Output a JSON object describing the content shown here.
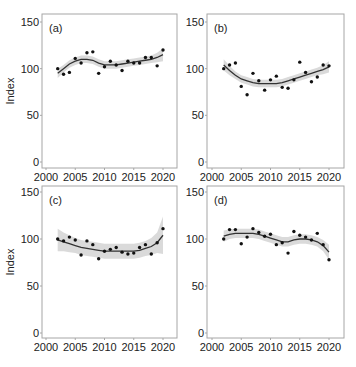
{
  "chart_data": [
    {
      "type": "scatter",
      "panel_label": "(a)",
      "ylabel": "Index",
      "xlabel": "",
      "xlim": [
        2000,
        2021
      ],
      "ylim": [
        0,
        150
      ],
      "x_ticks": [
        2000,
        2005,
        2010,
        2015,
        2020
      ],
      "y_ticks": [
        0,
        50,
        100,
        150
      ],
      "grid": false,
      "x": [
        2002,
        2003,
        2004,
        2005,
        2006,
        2007,
        2008,
        2009,
        2010,
        2011,
        2012,
        2013,
        2014,
        2015,
        2016,
        2017,
        2018,
        2019,
        2020
      ],
      "points": [
        100,
        94,
        96,
        111,
        106,
        117,
        118,
        95,
        102,
        108,
        104,
        98,
        108,
        106,
        106,
        112,
        112,
        103,
        120
      ],
      "smooth": [
        95,
        100,
        105,
        108,
        110,
        110,
        109,
        106,
        104,
        104,
        104,
        105,
        106,
        107,
        108,
        109,
        110,
        112,
        115
      ],
      "ci_halfwidth": [
        5,
        4,
        4,
        4,
        4,
        4,
        4,
        4,
        4,
        4,
        4,
        4,
        4,
        4,
        4,
        4,
        4,
        5,
        7
      ]
    },
    {
      "type": "scatter",
      "panel_label": "(b)",
      "ylabel": "",
      "xlabel": "",
      "xlim": [
        2000,
        2021
      ],
      "ylim": [
        0,
        150
      ],
      "x_ticks": [
        2000,
        2005,
        2010,
        2015,
        2020
      ],
      "y_ticks": [
        0,
        50,
        100,
        150
      ],
      "grid": false,
      "x": [
        2002,
        2003,
        2004,
        2005,
        2006,
        2007,
        2008,
        2009,
        2010,
        2011,
        2012,
        2013,
        2014,
        2015,
        2016,
        2017,
        2018,
        2019,
        2020
      ],
      "points": [
        100,
        104,
        106,
        81,
        72,
        95,
        87,
        77,
        88,
        92,
        80,
        79,
        88,
        107,
        96,
        86,
        91,
        104,
        103
      ],
      "smooth": [
        104,
        98,
        93,
        89,
        87,
        85,
        84,
        84,
        84,
        84,
        85,
        87,
        89,
        91,
        93,
        95,
        97,
        99,
        102
      ],
      "ci_halfwidth": [
        6,
        5,
        4,
        4,
        4,
        4,
        4,
        4,
        4,
        4,
        4,
        4,
        4,
        4,
        4,
        4,
        4,
        5,
        6
      ]
    },
    {
      "type": "scatter",
      "panel_label": "(c)",
      "ylabel": "Index",
      "xlabel": "",
      "xlim": [
        2000,
        2021
      ],
      "ylim": [
        0,
        150
      ],
      "x_ticks": [
        2000,
        2005,
        2010,
        2015,
        2020
      ],
      "y_ticks": [
        0,
        50,
        100,
        150
      ],
      "grid": false,
      "x": [
        2002,
        2003,
        2004,
        2005,
        2006,
        2007,
        2008,
        2009,
        2010,
        2011,
        2012,
        2013,
        2014,
        2015,
        2016,
        2017,
        2018,
        2019,
        2020
      ],
      "points": [
        100,
        98,
        102,
        99,
        83,
        98,
        94,
        79,
        87,
        89,
        91,
        86,
        84,
        85,
        91,
        94,
        84,
        96,
        111
      ],
      "smooth": [
        99,
        97,
        95,
        93,
        91,
        90,
        89,
        88,
        87,
        87,
        87,
        87,
        87,
        87,
        88,
        90,
        92,
        96,
        104
      ],
      "ci_halfwidth": [
        12,
        10,
        9,
        8,
        8,
        8,
        8,
        8,
        8,
        8,
        8,
        8,
        8,
        8,
        8,
        8,
        9,
        11,
        20
      ]
    },
    {
      "type": "scatter",
      "panel_label": "(d)",
      "ylabel": "",
      "xlabel": "",
      "xlim": [
        2000,
        2021
      ],
      "ylim": [
        0,
        150
      ],
      "x_ticks": [
        2000,
        2005,
        2010,
        2015,
        2020
      ],
      "y_ticks": [
        0,
        50,
        100,
        150
      ],
      "grid": false,
      "x": [
        2002,
        2003,
        2004,
        2005,
        2006,
        2007,
        2008,
        2009,
        2010,
        2011,
        2012,
        2013,
        2014,
        2015,
        2016,
        2017,
        2018,
        2019,
        2020
      ],
      "points": [
        100,
        110,
        110,
        95,
        102,
        111,
        107,
        103,
        105,
        94,
        96,
        85,
        108,
        104,
        102,
        99,
        106,
        94,
        78
      ],
      "smooth": [
        103,
        105,
        106,
        106,
        106,
        106,
        105,
        103,
        101,
        99,
        97,
        97,
        99,
        100,
        100,
        99,
        97,
        93,
        86
      ],
      "ci_halfwidth": [
        6,
        5,
        5,
        5,
        5,
        5,
        5,
        5,
        5,
        5,
        5,
        5,
        5,
        5,
        5,
        5,
        5,
        6,
        8
      ]
    }
  ],
  "panels_layout": [
    {
      "frame": [
        42,
        14,
        177,
        168
      ],
      "y0": 162,
      "y150": 22,
      "x2000": 46,
      "x2020": 163
    },
    {
      "frame": [
        207,
        14,
        344,
        168
      ],
      "y0": 162,
      "y150": 22,
      "x2000": 212,
      "x2020": 329
    },
    {
      "frame": [
        42,
        186,
        177,
        338
      ],
      "y0": 333,
      "y150": 192,
      "x2000": 46,
      "x2020": 163
    },
    {
      "frame": [
        207,
        186,
        344,
        338
      ],
      "y0": 333,
      "y150": 192,
      "x2000": 212,
      "x2020": 329
    }
  ],
  "colors": {
    "point": "#111111",
    "line": "#333333",
    "ribbon": "#d3d3d3",
    "frame": "#a6a6a6",
    "text": "#222222"
  }
}
